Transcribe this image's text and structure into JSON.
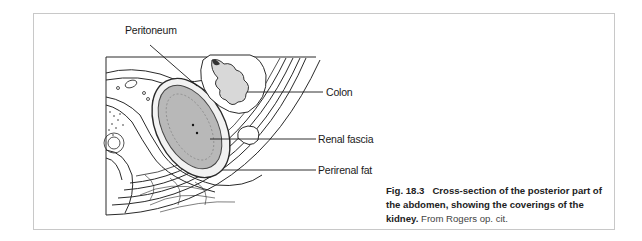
{
  "figure": {
    "labels": {
      "peritoneum": "Peritoneum",
      "colon": "Colon",
      "renal_fascia": "Renal fascia",
      "perirenal_fat": "Perirenal fat"
    },
    "caption": {
      "number": "Fig. 18.3",
      "title_bold": "Cross-section of the posterior part of the abdomen, showing the coverings of the kidney.",
      "source": "From Rogers op. cit."
    },
    "colors": {
      "kidney_fill": "#b8b8b8",
      "line": "#2a2a2a",
      "frame_border": "#c8c8c8"
    }
  }
}
